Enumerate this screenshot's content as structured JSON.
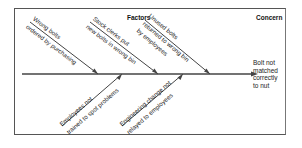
{
  "headers": {
    "factors": "Factors",
    "concern": "Concern"
  },
  "concern": {
    "lines": [
      "Bolt not",
      "matched",
      "correctly",
      "to nut"
    ]
  },
  "factors_top": [
    {
      "line1": "Wrong bolts",
      "line2": "ordered by purchasing",
      "line3": ""
    },
    {
      "line1": "Stock clerks put",
      "line2": "new bolts in wrong bin",
      "line3": ""
    },
    {
      "line1": "Unused bolts",
      "line2": "returned to wrong bin",
      "line3": "by employees"
    }
  ],
  "factors_bottom": [
    {
      "line1": "Employees not",
      "line2": "trained to spot problems"
    },
    {
      "line1": "Engineering change not",
      "line2": "relayed to employees"
    }
  ],
  "colors": {
    "line": "#333333",
    "frame": "#555555",
    "text": "#222222"
  }
}
